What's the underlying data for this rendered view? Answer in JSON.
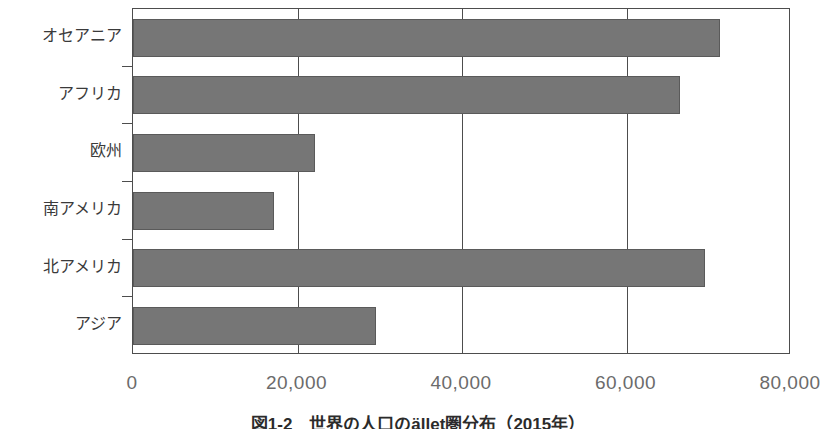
{
  "chart_data": {
    "type": "bar",
    "orientation": "horizontal",
    "title": "",
    "caption": "図1-2　世界の人口のället圏分布（2015年）",
    "xlabel": "",
    "ylabel": "",
    "categories": [
      "オセアニア",
      "アフリカ",
      "欧州",
      "南アメリカ",
      "北アメリカ",
      "アジア"
    ],
    "values": [
      71400,
      66500,
      22100,
      17200,
      69600,
      29600
    ],
    "xlim": [
      0,
      80000
    ],
    "xticks": [
      0,
      20000,
      40000,
      60000,
      80000
    ],
    "xtick_labels": [
      "0",
      "20,000",
      "40,000",
      "60,000",
      "80,000"
    ],
    "grid": true,
    "grid_axis": "x",
    "legend": null,
    "bar_color": "#767676",
    "axis_color": "#4d4d4d",
    "label_color": "#3a3a3a",
    "tick_label_color": "#6b6b6b",
    "background": "#ffffff"
  }
}
